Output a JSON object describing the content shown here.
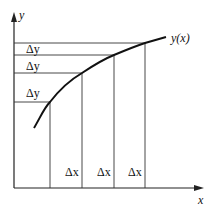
{
  "axes": {
    "x_label": "x",
    "y_label": "y",
    "color": "#222222"
  },
  "curve": {
    "label": "y(x)",
    "color": "#111111"
  },
  "increments": {
    "dy_labels": [
      "Δy",
      "Δy",
      "Δy"
    ],
    "dx_labels": [
      "Δx",
      "Δx",
      "Δx"
    ]
  },
  "guide_line_color": "#333333"
}
